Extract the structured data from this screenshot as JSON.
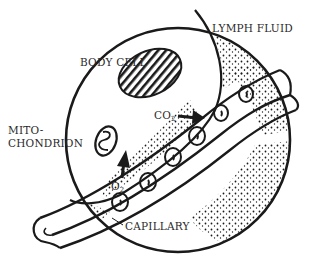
{
  "diagram": {
    "colors": {
      "ink": "#1a1a1a",
      "background": "#ffffff",
      "label": "#2a2a2a"
    },
    "labels": {
      "lymph_fluid": "LYMPH FLUID",
      "body_cell": "BODY CELL",
      "mitochondrion_line1": "MITO-",
      "mitochondrion_line2": "CHONDRION",
      "co2": "CO",
      "co2_sub": "2",
      "o2": "O",
      "o2_sub": "2",
      "capillary": "CAPILLARY"
    },
    "arrows": [
      {
        "name": "co2-arrow",
        "from": "body cell",
        "to": "capillary"
      },
      {
        "name": "o2-arrow",
        "from": "capillary",
        "to": "body cell"
      }
    ]
  }
}
